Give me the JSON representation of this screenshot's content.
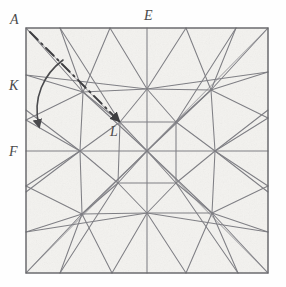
{
  "figure": {
    "medium": "hand-drawn pencil on textured paper",
    "paper_color": "#f2f1ee",
    "crease_color": "#6e6e72",
    "edge_color": "#6b6b6f",
    "accent_color": "#3a3a3c",
    "canvas": {
      "width": 286,
      "height": 287
    },
    "square": {
      "x": 26,
      "y": 28,
      "width": 242,
      "height": 245
    }
  },
  "labels": [
    {
      "id": "A",
      "text": "A",
      "x": 10,
      "y": 12,
      "anchor": "top-left-corner-outside"
    },
    {
      "id": "E",
      "text": "E",
      "x": 144,
      "y": 8,
      "anchor": "top-edge-midpoint-outside"
    },
    {
      "id": "K",
      "text": "K",
      "x": 9,
      "y": 78,
      "anchor": "left-edge-upper-outside"
    },
    {
      "id": "F",
      "text": "F",
      "x": 9,
      "y": 144,
      "anchor": "left-edge-midpoint-outside"
    },
    {
      "id": "L",
      "text": "L",
      "x": 110,
      "y": 124,
      "anchor": "interior-point"
    }
  ],
  "annotations": {
    "fold_line": {
      "name": "valley-fold-dash-dot-line",
      "style": "dash-dot",
      "from": {
        "x": 30,
        "y": 32,
        "label": "A"
      },
      "to": {
        "x": 120,
        "y": 122,
        "label": "L"
      },
      "arrowhead": "at-L"
    },
    "rotation_arrow": {
      "name": "fold-direction-curved-arrow",
      "style": "curved-solid",
      "start": {
        "x": 63,
        "y": 60
      },
      "control": {
        "x": 30,
        "y": 92
      },
      "end": {
        "x": 40,
        "y": 128
      },
      "arrowhead": "at-end-pointing-down"
    }
  },
  "geometry": {
    "note": "Square sheet with symmetric radial crease network; hubs where many creases converge.",
    "hubs": [
      {
        "x": 147,
        "y": 151,
        "name": "center-hub"
      },
      {
        "x": 147,
        "y": 89,
        "name": "upper-mid-hub"
      },
      {
        "x": 80,
        "y": 151,
        "name": "left-mid-hub"
      },
      {
        "x": 215,
        "y": 151,
        "name": "right-mid-hub"
      },
      {
        "x": 147,
        "y": 213,
        "name": "lower-mid-hub"
      },
      {
        "x": 83,
        "y": 92,
        "name": "upper-left-hub"
      },
      {
        "x": 211,
        "y": 90,
        "name": "upper-right-hub"
      },
      {
        "x": 82,
        "y": 214,
        "name": "lower-left-hub"
      },
      {
        "x": 212,
        "y": 213,
        "name": "lower-right-hub"
      },
      {
        "x": 120,
        "y": 122,
        "name": "point-L-hub"
      },
      {
        "x": 176,
        "y": 122,
        "name": "inner-ne-hub"
      },
      {
        "x": 118,
        "y": 183,
        "name": "inner-sw-hub"
      },
      {
        "x": 176,
        "y": 183,
        "name": "inner-se-hub"
      }
    ],
    "edges": {
      "top": {
        "y": 28
      },
      "bottom": {
        "y": 273
      },
      "left": {
        "x": 26
      },
      "right": {
        "x": 268
      }
    }
  }
}
